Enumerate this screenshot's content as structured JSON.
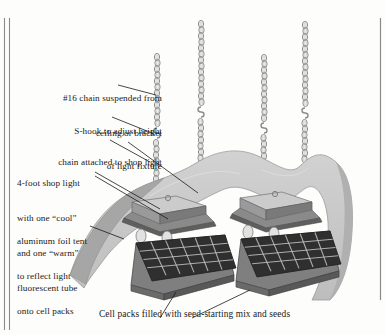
{
  "figure": {
    "title_caption": "Cell packs filled with seed-starting mix and seeds",
    "background_color": "#fdfdfb",
    "ink_color": "#1a1a1a",
    "foil_color": "#c8c8c8",
    "foil_shadow_color": "#9a9a9a",
    "fixture_top_color": "#cfcfcf",
    "fixture_side_color": "#8f8f8f",
    "fixture_dark_color": "#6e6e6e",
    "pack_top_color": "#3a3a3a",
    "pack_front_color": "#7a7a7a",
    "chain_color": "#9d9d9d"
  },
  "labels": [
    {
      "name": "chain-suspended",
      "line1": "#16 chain suspended from",
      "line2": "ceiling or bracket"
    },
    {
      "name": "s-hook",
      "line1": "S-hook to adjust height",
      "line2": "of light fixture"
    },
    {
      "name": "chain-attached",
      "line1": "chain attached to shop light",
      "line2": ""
    },
    {
      "name": "shop-light",
      "line1": "4-foot shop light",
      "line2": "with one “cool”",
      "line3": "and one “warm”",
      "line4": "fluorescent tube"
    },
    {
      "name": "foil-tent",
      "line1": "aluminum foil tent",
      "line2": "to reflect light",
      "line3": "onto cell packs"
    }
  ],
  "caption": "Cell packs filled with seed-starting mix and seeds",
  "diagram_parts": {
    "chains": 4,
    "light_fixtures": 2,
    "cell_packs": 2,
    "cells_per_pack_cols": 6,
    "cells_per_pack_rows": 4,
    "tubes_per_fixture": 2
  }
}
